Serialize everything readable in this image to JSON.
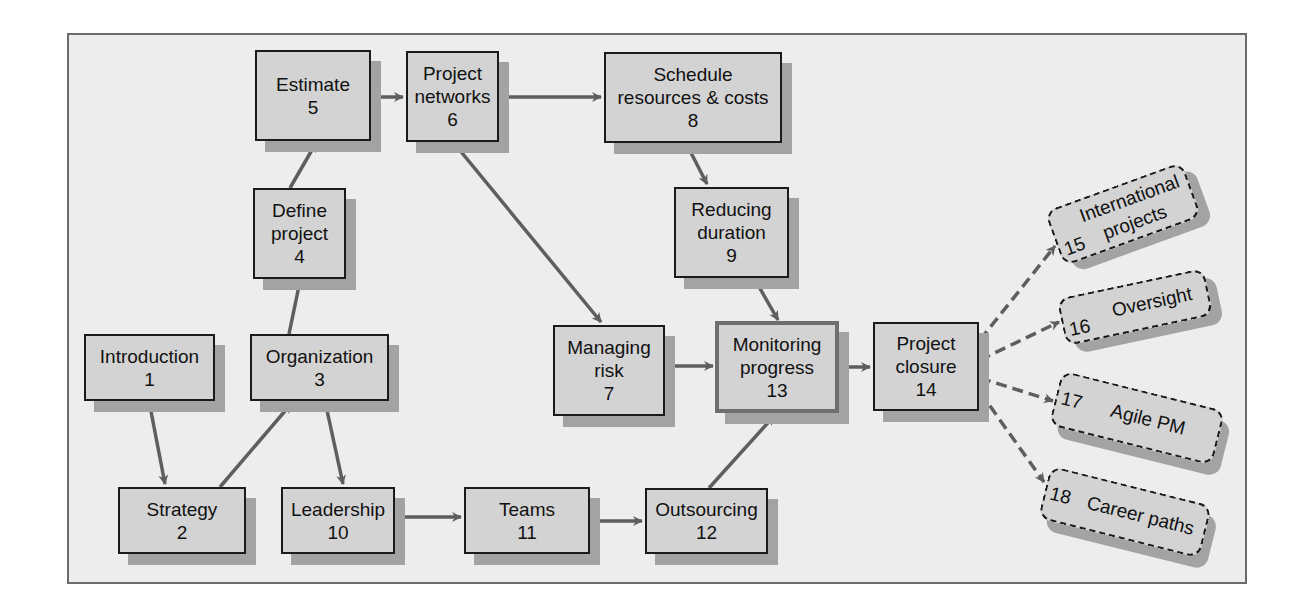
{
  "diagram": {
    "title": "",
    "colors": {
      "node_fill": "#d3d3d3",
      "node_border": "#1a1a1a",
      "shadow": "#a3a3a3",
      "arrow": "#5e5e5e",
      "background": "#ededed"
    },
    "nodes": [
      {
        "id": "1",
        "label_lines": [
          "Introduction",
          "1"
        ]
      },
      {
        "id": "2",
        "label_lines": [
          "Strategy",
          "2"
        ]
      },
      {
        "id": "3",
        "label_lines": [
          "Organization",
          "3"
        ]
      },
      {
        "id": "4",
        "label_lines": [
          "Define",
          "project",
          "4"
        ]
      },
      {
        "id": "5",
        "label_lines": [
          "Estimate",
          "5"
        ]
      },
      {
        "id": "6",
        "label_lines": [
          "Project",
          "networks",
          "6"
        ]
      },
      {
        "id": "7",
        "label_lines": [
          "Managing",
          "risk",
          "7"
        ]
      },
      {
        "id": "8",
        "label_lines": [
          "Schedule",
          "resources & costs",
          "8"
        ]
      },
      {
        "id": "9",
        "label_lines": [
          "Reducing",
          "duration",
          "9"
        ]
      },
      {
        "id": "10",
        "label_lines": [
          "Leadership",
          "10"
        ]
      },
      {
        "id": "11",
        "label_lines": [
          "Teams",
          "11"
        ]
      },
      {
        "id": "12",
        "label_lines": [
          "Outsourcing",
          "12"
        ]
      },
      {
        "id": "13",
        "label_lines": [
          "Monitoring",
          "progress",
          "13"
        ]
      },
      {
        "id": "14",
        "label_lines": [
          "Project",
          "closure",
          "14"
        ]
      }
    ],
    "optional_nodes": [
      {
        "id": "15",
        "label": "International projects",
        "label_lines": [
          "International",
          "projects"
        ],
        "number": "15"
      },
      {
        "id": "16",
        "label": "Oversight",
        "number": "16"
      },
      {
        "id": "17",
        "label": "Agile PM",
        "number": "17"
      },
      {
        "id": "18",
        "label": "Career paths",
        "number": "18"
      }
    ],
    "edges": [
      {
        "from": "1",
        "to": "2",
        "style": "solid"
      },
      {
        "from": "2",
        "to": "3",
        "style": "solid"
      },
      {
        "from": "3",
        "to": "4",
        "style": "solid"
      },
      {
        "from": "3",
        "to": "10",
        "style": "solid"
      },
      {
        "from": "4",
        "to": "5",
        "style": "solid"
      },
      {
        "from": "5",
        "to": "6",
        "style": "solid"
      },
      {
        "from": "6",
        "to": "8",
        "style": "solid"
      },
      {
        "from": "6",
        "to": "7",
        "style": "solid"
      },
      {
        "from": "8",
        "to": "9",
        "style": "solid"
      },
      {
        "from": "9",
        "to": "13",
        "style": "solid"
      },
      {
        "from": "7",
        "to": "13",
        "style": "solid"
      },
      {
        "from": "10",
        "to": "11",
        "style": "solid"
      },
      {
        "from": "11",
        "to": "12",
        "style": "solid"
      },
      {
        "from": "12",
        "to": "13",
        "style": "solid"
      },
      {
        "from": "13",
        "to": "14",
        "style": "solid"
      },
      {
        "from": "14",
        "to": "15",
        "style": "dashed"
      },
      {
        "from": "14",
        "to": "16",
        "style": "dashed"
      },
      {
        "from": "14",
        "to": "17",
        "style": "dashed"
      },
      {
        "from": "14",
        "to": "18",
        "style": "dashed"
      }
    ]
  }
}
